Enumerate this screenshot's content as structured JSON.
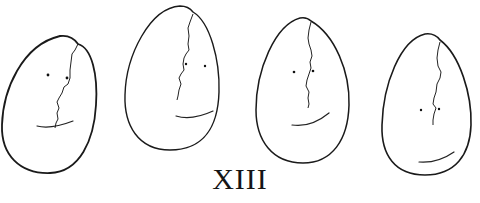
{
  "figure": {
    "caption": "XIII",
    "items": [
      {
        "label": "egg-face-1",
        "features": [
          "crack",
          "two-eyes",
          "mouth-curve"
        ]
      },
      {
        "label": "egg-face-2",
        "features": [
          "crack",
          "two-eyes",
          "mouth-curve"
        ]
      },
      {
        "label": "egg-face-3",
        "features": [
          "crack",
          "two-eyes",
          "mouth-curve"
        ]
      },
      {
        "label": "egg-face-4",
        "features": [
          "crack",
          "two-eyes",
          "mouth-curve"
        ]
      }
    ]
  }
}
